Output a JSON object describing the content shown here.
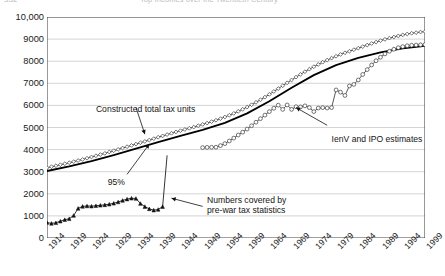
{
  "page": {
    "cut_page_number": "332",
    "cut_running_title": "Top Incomes over the Twentieth Century"
  },
  "chart_data": {
    "type": "line",
    "title": "",
    "subtitle": "",
    "xlabel": "",
    "ylabel": "",
    "xlim": [
      1914,
      1999
    ],
    "ylim": [
      0,
      10000
    ],
    "ytick_step": 1000,
    "xtick_step": 5,
    "grid": "horizontal",
    "legend_position": "none",
    "yticks": [
      "0",
      "1000",
      "2000",
      "3000",
      "4000",
      "5000",
      "6000",
      "7000",
      "8000",
      "9000",
      "10,000"
    ],
    "xticks": [
      "1914",
      "1919",
      "1924",
      "1929",
      "1934",
      "1939",
      "1944",
      "1949",
      "1954",
      "1959",
      "1964",
      "1969",
      "1974",
      "1979",
      "1984",
      "1989",
      "1994",
      "1999"
    ],
    "annotations": [
      {
        "id": "constructed",
        "text": "Constructed total tax units",
        "x": 1925,
        "y": 6050,
        "target_x": 1936,
        "target_y": 4700
      },
      {
        "id": "ninetyfive",
        "text": "95%",
        "x": 1929,
        "y": 2750,
        "target_x": 1937,
        "target_y": 4250
      },
      {
        "id": "prewar",
        "text": "Numbers covered by\npre-war tax statistics",
        "x": 1950,
        "y": 1950,
        "target_x": 1942,
        "target_y": 1800
      },
      {
        "id": "ienv",
        "text": "IenV and IPO estimates",
        "x": 1978,
        "y": 4700,
        "target_x": 1970,
        "target_y": 5900
      }
    ],
    "annotation_lines": {
      "constructed": "Constructed total tax units",
      "ninetyfive": "95%",
      "prewar_line1": "Numbers covered by",
      "prewar_line2": "pre-war tax statistics",
      "ienv": "IenV and IPO estimates"
    },
    "series": [
      {
        "name": "Constructed total tax units",
        "marker": "diamond-open",
        "color": "#3b3b3b",
        "x": [
          1914,
          1915,
          1916,
          1917,
          1918,
          1919,
          1920,
          1921,
          1922,
          1923,
          1924,
          1925,
          1926,
          1927,
          1928,
          1929,
          1930,
          1931,
          1932,
          1933,
          1934,
          1935,
          1936,
          1937,
          1938,
          1939,
          1940,
          1941,
          1942,
          1943,
          1944,
          1945,
          1946,
          1947,
          1948,
          1949,
          1950,
          1951,
          1952,
          1953,
          1954,
          1955,
          1956,
          1957,
          1958,
          1959,
          1960,
          1961,
          1962,
          1963,
          1964,
          1965,
          1966,
          1967,
          1968,
          1969,
          1970,
          1971,
          1972,
          1973,
          1974,
          1975,
          1976,
          1977,
          1978,
          1979,
          1980,
          1981,
          1982,
          1983,
          1984,
          1985,
          1986,
          1987,
          1988,
          1989,
          1990,
          1991,
          1992,
          1993,
          1994,
          1995,
          1996,
          1997,
          1998,
          1999
        ],
        "y": [
          3180,
          3225,
          3270,
          3315,
          3360,
          3405,
          3455,
          3505,
          3555,
          3610,
          3665,
          3720,
          3775,
          3830,
          3890,
          3950,
          4010,
          4070,
          4130,
          4190,
          4250,
          4310,
          4370,
          4430,
          4495,
          4560,
          4620,
          4680,
          4740,
          4800,
          4855,
          4910,
          4965,
          5020,
          5080,
          5140,
          5200,
          5265,
          5330,
          5400,
          5475,
          5555,
          5640,
          5730,
          5825,
          5925,
          6030,
          6140,
          6255,
          6375,
          6500,
          6630,
          6760,
          6890,
          7020,
          7150,
          7280,
          7405,
          7525,
          7640,
          7750,
          7855,
          7955,
          8050,
          8140,
          8225,
          8305,
          8380,
          8450,
          8520,
          8590,
          8660,
          8730,
          8800,
          8865,
          8930,
          8990,
          9045,
          9095,
          9145,
          9190,
          9230,
          9265,
          9295,
          9320,
          9340
        ]
      },
      {
        "name": "95 percent line",
        "marker": "none",
        "color": "#000000",
        "x": [
          1914,
          1919,
          1924,
          1929,
          1934,
          1939,
          1944,
          1949,
          1954,
          1959,
          1964,
          1969,
          1974,
          1979,
          1984,
          1989,
          1994,
          1999
        ],
        "y": [
          3030,
          3240,
          3480,
          3755,
          4040,
          4335,
          4620,
          4890,
          5210,
          5640,
          6185,
          6800,
          7370,
          7820,
          8150,
          8400,
          8580,
          8690
        ]
      },
      {
        "name": "IenV and IPO estimates",
        "marker": "circle-open",
        "color": "#3b3b3b",
        "x": [
          1949,
          1950,
          1951,
          1952,
          1953,
          1954,
          1955,
          1956,
          1957,
          1958,
          1959,
          1960,
          1961,
          1962,
          1963,
          1964,
          1965,
          1966,
          1967,
          1968,
          1969,
          1970,
          1971,
          1972,
          1973,
          1974,
          1975,
          1976,
          1977,
          1978,
          1979,
          1980,
          1981,
          1982,
          1983,
          1984,
          1985,
          1986,
          1987,
          1988,
          1989,
          1990,
          1991,
          1992,
          1993,
          1994,
          1995,
          1996,
          1997,
          1998,
          1999
        ],
        "y": [
          4090,
          4100,
          4105,
          4110,
          4180,
          4270,
          4390,
          4520,
          4660,
          4790,
          4930,
          5080,
          5240,
          5400,
          5560,
          5720,
          5870,
          6010,
          5820,
          6020,
          5820,
          5940,
          5930,
          5980,
          5900,
          5720,
          5880,
          5900,
          5880,
          5900,
          6700,
          6600,
          6450,
          6880,
          6950,
          7150,
          7400,
          7620,
          7830,
          8020,
          8180,
          8330,
          8450,
          8540,
          8610,
          8660,
          8700,
          8720,
          8730,
          8740,
          8750
        ]
      },
      {
        "name": "Numbers covered by pre-war tax statistics",
        "marker": "triangle-filled",
        "color": "#111111",
        "x": [
          1914,
          1915,
          1916,
          1917,
          1918,
          1919,
          1920,
          1921,
          1922,
          1923,
          1924,
          1925,
          1926,
          1927,
          1928,
          1929,
          1930,
          1931,
          1932,
          1933,
          1934,
          1935,
          1936,
          1937,
          1938,
          1939,
          1940
        ],
        "y": [
          700,
          660,
          690,
          760,
          830,
          870,
          1020,
          1340,
          1430,
          1450,
          1440,
          1460,
          1480,
          1500,
          1530,
          1570,
          1630,
          1700,
          1760,
          1800,
          1790,
          1560,
          1420,
          1320,
          1260,
          1290,
          1420
        ]
      },
      {
        "name": "pre-war tail rise",
        "marker": "none",
        "color": "#111111",
        "x": [
          1940,
          1941
        ],
        "y": [
          1420,
          3720
        ]
      }
    ]
  }
}
